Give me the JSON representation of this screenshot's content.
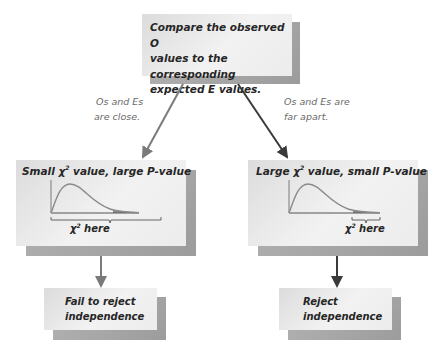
{
  "top_box": {
    "line1": "Compare the observed O",
    "line2": "values to the corresponding",
    "line3": "expected E values."
  },
  "branches": {
    "left_label_line1": "Os and Es",
    "left_label_line2": "are close.",
    "right_label_line1": "Os and Es are",
    "right_label_line2": "far apart."
  },
  "left_panel": {
    "title_prefix": "Small ",
    "chi": "χ",
    "sup": "2",
    "title_suffix": " value, large P-value",
    "here_chi": "χ",
    "here_sup": "2",
    "here_text": " here",
    "shaded_region": "right tail (large area)"
  },
  "right_panel": {
    "title_prefix": "Large ",
    "chi": "χ",
    "sup": "2",
    "title_suffix": " value, small P-value",
    "here_chi": "χ",
    "here_sup": "2",
    "here_text": " here",
    "shaded_region": "far right tail (small area)"
  },
  "outcomes": {
    "left_line1": "Fail to reject",
    "left_line2": "independence",
    "right_line1": "Reject",
    "right_line2": "independence"
  },
  "colors": {
    "box_fill": "#ececec",
    "box_shadow": "#a8a8a8",
    "curve": "#8a8a8a",
    "arrow_light": "#7a7a7a",
    "arrow_dark": "#3a3a3a",
    "text": "#262626"
  }
}
